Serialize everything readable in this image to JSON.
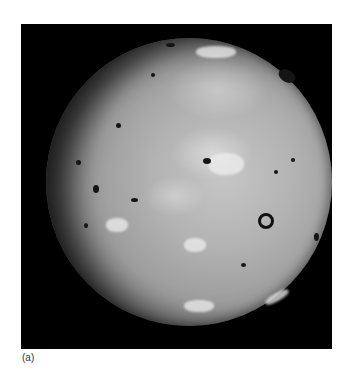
{
  "figure": {
    "caption": "(a)",
    "colors": {
      "background": "#ffffff",
      "frame": "#000000",
      "surface": "#b3b3b3"
    }
  }
}
